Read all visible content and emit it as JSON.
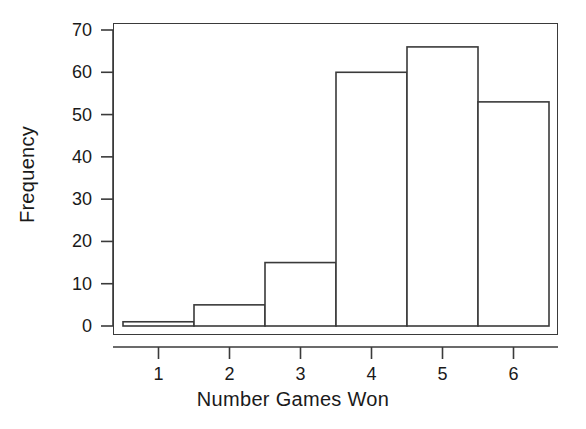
{
  "chart_data": {
    "type": "bar",
    "title": "",
    "subtitle": "",
    "xlabel": "Number Games Won",
    "ylabel": "Frequency",
    "categories": [
      "1",
      "2",
      "3",
      "4",
      "5",
      "6"
    ],
    "values": [
      1,
      5,
      15,
      60,
      66,
      53
    ],
    "series": [
      {
        "name": "Frequency",
        "values": [
          1,
          5,
          15,
          60,
          66,
          53
        ]
      }
    ],
    "xlim": [
      0.5,
      6.5
    ],
    "ylim": [
      0,
      70
    ],
    "yticks": [
      0,
      10,
      20,
      30,
      40,
      50,
      60,
      70
    ],
    "ytick_labels": [
      "0",
      "10",
      "20",
      "30",
      "40",
      "50",
      "60",
      "70"
    ],
    "xticks": [
      1,
      2,
      3,
      4,
      5,
      6
    ],
    "xtick_labels": [
      "1",
      "2",
      "3",
      "4",
      "5",
      "6"
    ],
    "bin_edges": [
      0.5,
      1.5,
      2.5,
      3.5,
      4.5,
      5.5,
      6.5
    ],
    "grid": false,
    "legend": null,
    "annotations": [],
    "bar_fill_color": "#ffffff",
    "bar_edge_color": "#3a3a3a",
    "axis_color": "#3a3a3a",
    "text_color": "#1a1a1a",
    "background_color": "#ffffff"
  }
}
